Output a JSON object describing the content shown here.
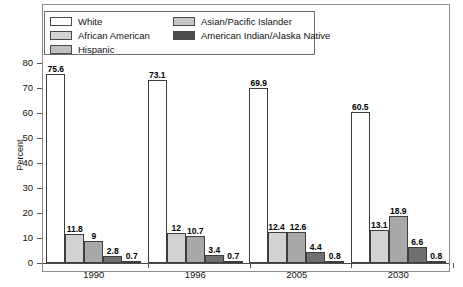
{
  "chart_data": {
    "type": "bar",
    "title": "",
    "subtitle": "",
    "xlabel": "",
    "ylabel": "Percent",
    "ylim": [
      0,
      80
    ],
    "yticks": [
      0,
      10,
      20,
      30,
      40,
      50,
      60,
      70,
      80
    ],
    "grid": false,
    "legend_position": "top-inside",
    "categories": [
      "1990",
      "1996",
      "2005",
      "2030"
    ],
    "series": [
      {
        "name": "White",
        "color": "#ffffff",
        "values": [
          75.6,
          73.1,
          69.9,
          60.5
        ],
        "labels": [
          "75.6",
          "73.1",
          "69.9",
          "60.5"
        ]
      },
      {
        "name": "African American",
        "color": "#d2d2d2",
        "values": [
          11.8,
          12.0,
          12.4,
          13.1
        ],
        "labels": [
          "11.8",
          "12",
          "12.4",
          "13.1"
        ]
      },
      {
        "name": "Hispanic",
        "color": "#a8a8a8",
        "values": [
          9.0,
          10.7,
          12.6,
          18.9
        ],
        "labels": [
          "9",
          "10.7",
          "12.6",
          "18.9"
        ]
      },
      {
        "name": "Asian/Pacific Islander",
        "color": "#707070",
        "values": [
          2.8,
          3.4,
          4.4,
          6.6
        ],
        "labels": [
          "2.8",
          "3.4",
          "4.4",
          "6.6"
        ]
      },
      {
        "name": "American Indian/Alaska Native",
        "color": "#1e1e1e",
        "values": [
          0.7,
          0.7,
          0.8,
          0.8
        ],
        "labels": [
          "0.7",
          "0.7",
          "0.8",
          "0.8"
        ]
      }
    ]
  },
  "legend": {
    "entries": [
      {
        "label": "White",
        "swatch": "#ffffff"
      },
      {
        "label": "African American",
        "swatch": "#d2d2d2"
      },
      {
        "label": "Hispanic",
        "swatch": "#c0c0c0"
      },
      {
        "label": "Asian/Pacific Islander",
        "swatch": "#c6c6c6"
      },
      {
        "label": "American Indian/Alaska Native",
        "swatch": "#4d4d4d"
      }
    ]
  },
  "axes": {
    "y_title": "Percent",
    "y_tick_labels": [
      "80",
      "70",
      "60",
      "50",
      "40",
      "30",
      "20",
      "10",
      "0"
    ],
    "x_tick_labels": [
      "1990",
      "1996",
      "2005",
      "2030"
    ]
  }
}
